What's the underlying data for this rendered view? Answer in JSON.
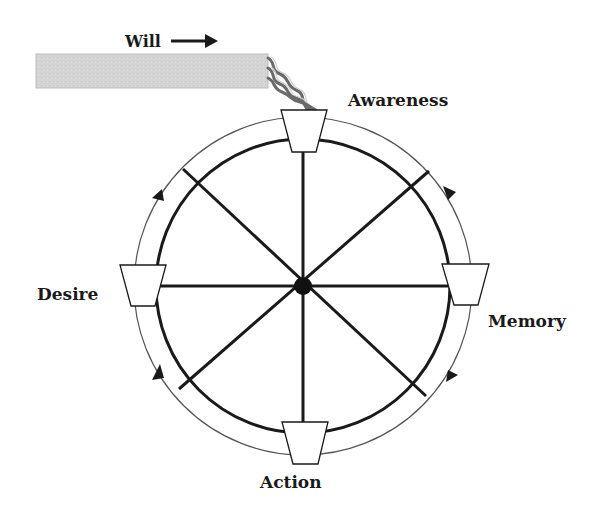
{
  "diagram": {
    "will": {
      "label": "Will",
      "arrow": "right-arrow"
    },
    "nodes": {
      "top": {
        "label": "Awareness"
      },
      "right": {
        "label": "Memory"
      },
      "bottom": {
        "label": "Action"
      },
      "left": {
        "label": "Desire"
      }
    },
    "flow_direction": "clockwise",
    "colors": {
      "will_bar": "#d3d3d3",
      "stroke": "#1a1a1a",
      "outer_ring": "#555555",
      "stream_dark": "#666666",
      "stream_light": "#c8c8c8",
      "bucket_fill": "#ffffff"
    }
  }
}
